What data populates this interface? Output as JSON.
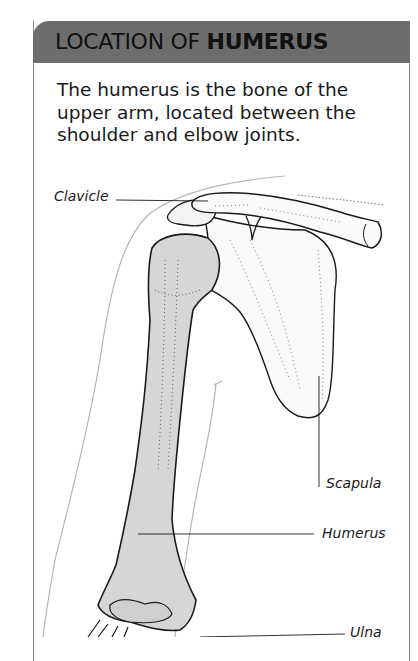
{
  "header": {
    "title_regular": "LOCATION OF ",
    "title_bold": "HUMERUS"
  },
  "intro": {
    "lines": [
      "The humerus is the bone of the",
      "upper arm, located between the",
      "shoulder and elbow joints."
    ]
  },
  "labels": {
    "clavicle": "Clavicle",
    "scapula": "Scapula",
    "humerus": "Humerus",
    "ulna": "Ulna"
  },
  "colors": {
    "header_bg": "#6d6d6d",
    "bone_fill": "#d6d6d6",
    "outline": "#1a1a1a"
  }
}
